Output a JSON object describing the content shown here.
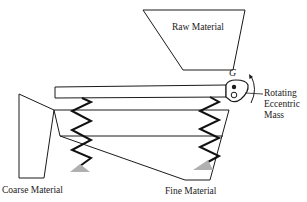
{
  "diagram": {
    "type": "vibrating-screen-schematic",
    "labels": {
      "raw_material": "Raw Material",
      "center_of_gravity": "G",
      "rotating_line1": "Rotating",
      "rotating_line2": "Eccentric",
      "rotating_line3": "Mass",
      "coarse_material": "Coarse Material",
      "fine_material": "Fine Material"
    },
    "components": [
      "hopper",
      "top-beam",
      "eccentric-mass",
      "rotation-arrow",
      "screen-deck",
      "springs",
      "supports",
      "coarse-chute",
      "fine-chute"
    ],
    "colors": {
      "line": "#1a1a1a",
      "support_fill": "#b0b0b0",
      "background": "#ffffff"
    }
  }
}
